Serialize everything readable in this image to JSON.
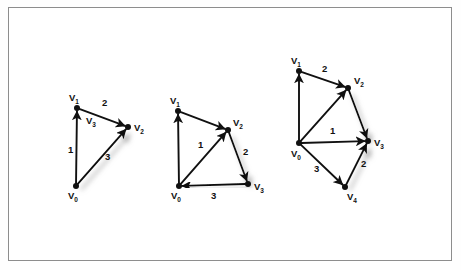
{
  "figure": {
    "title": "",
    "background_color": "#ffffff",
    "frame_color": "#8d8d8d",
    "ink_color": "#111111",
    "shadow_color": "#b9b9b9",
    "graph_count": 3
  },
  "graphs": [
    {
      "name": "graph-1",
      "vertices": [
        {
          "id": "v1",
          "label": "V",
          "sub": "1",
          "x": 77,
          "y": 108,
          "label_x": 69,
          "label_y": 101
        },
        {
          "id": "v2",
          "label": "V",
          "sub": "2",
          "x": 128,
          "y": 127,
          "label_x": 134,
          "label_y": 131
        },
        {
          "id": "v0",
          "label": "V",
          "sub": "0",
          "x": 76,
          "y": 186,
          "label_x": 68,
          "label_y": 199
        }
      ],
      "extra_labels": [
        {
          "id": "v3-note",
          "label": "V",
          "sub": "3",
          "x": 86,
          "y": 124
        }
      ],
      "edges": [
        {
          "id": "e-v0-v1",
          "from": "v0",
          "to": "v1",
          "weight": "1",
          "weight_x": 68,
          "weight_y": 153,
          "shadow": false
        },
        {
          "id": "e-v1-v2",
          "from": "v1",
          "to": "v2",
          "weight": "2",
          "weight_x": 102,
          "weight_y": 106,
          "shadow": false
        },
        {
          "id": "e-v0-v2",
          "from": "v0",
          "to": "v2",
          "weight": "3",
          "weight_x": 105,
          "weight_y": 160,
          "shadow": true
        }
      ]
    },
    {
      "name": "graph-2",
      "vertices": [
        {
          "id": "v1",
          "label": "V",
          "sub": "1",
          "x": 178,
          "y": 111,
          "label_x": 170,
          "label_y": 104
        },
        {
          "id": "v2",
          "label": "V",
          "sub": "2",
          "x": 228,
          "y": 130,
          "label_x": 233,
          "label_y": 126
        },
        {
          "id": "v3",
          "label": "V",
          "sub": "3",
          "x": 248,
          "y": 184,
          "label_x": 254,
          "label_y": 190
        },
        {
          "id": "v0",
          "label": "V",
          "sub": "0",
          "x": 179,
          "y": 186,
          "label_x": 171,
          "label_y": 199
        }
      ],
      "extra_labels": [],
      "edges": [
        {
          "id": "e-v0-v1",
          "from": "v0",
          "to": "v1",
          "weight": "",
          "weight_x": 0,
          "weight_y": 0,
          "shadow": false
        },
        {
          "id": "e-v1-v2",
          "from": "v1",
          "to": "v2",
          "weight": "",
          "weight_x": 0,
          "weight_y": 0,
          "shadow": false
        },
        {
          "id": "e-v0-v2",
          "from": "v0",
          "to": "v2",
          "weight": "1",
          "weight_x": 198,
          "weight_y": 148,
          "shadow": false
        },
        {
          "id": "e-v2-v3",
          "from": "v2",
          "to": "v3",
          "weight": "2",
          "weight_x": 243,
          "weight_y": 155,
          "shadow": true
        },
        {
          "id": "e-v3-v0",
          "from": "v3",
          "to": "v0",
          "weight": "3",
          "weight_x": 211,
          "weight_y": 199,
          "shadow": true
        }
      ]
    },
    {
      "name": "graph-3",
      "vertices": [
        {
          "id": "v1",
          "label": "V",
          "sub": "1",
          "x": 299,
          "y": 71,
          "label_x": 291,
          "label_y": 64
        },
        {
          "id": "v2",
          "label": "V",
          "sub": "2",
          "x": 348,
          "y": 88,
          "label_x": 354,
          "label_y": 84
        },
        {
          "id": "v3",
          "label": "V",
          "sub": "3",
          "x": 368,
          "y": 141,
          "label_x": 374,
          "label_y": 146
        },
        {
          "id": "v0",
          "label": "V",
          "sub": "0",
          "x": 299,
          "y": 143,
          "label_x": 291,
          "label_y": 157
        },
        {
          "id": "v4",
          "label": "V",
          "sub": "4",
          "x": 345,
          "y": 187,
          "label_x": 347,
          "label_y": 200
        }
      ],
      "extra_labels": [],
      "edges": [
        {
          "id": "e-v0-v1",
          "from": "v0",
          "to": "v1",
          "weight": "",
          "weight_x": 0,
          "weight_y": 0,
          "shadow": false
        },
        {
          "id": "e-v1-v2",
          "from": "v1",
          "to": "v2",
          "weight": "2",
          "weight_x": 322,
          "weight_y": 72,
          "shadow": false
        },
        {
          "id": "e-v0-v2",
          "from": "v0",
          "to": "v2",
          "weight": "",
          "weight_x": 0,
          "weight_y": 0,
          "shadow": false
        },
        {
          "id": "e-v2-v3",
          "from": "v2",
          "to": "v3",
          "weight": "",
          "weight_x": 0,
          "weight_y": 0,
          "shadow": true
        },
        {
          "id": "e-v0-v3",
          "from": "v0",
          "to": "v3",
          "weight": "1",
          "weight_x": 330,
          "weight_y": 134,
          "shadow": false
        },
        {
          "id": "e-v0-v4",
          "from": "v0",
          "to": "v4",
          "weight": "3",
          "weight_x": 314,
          "weight_y": 172,
          "shadow": false
        },
        {
          "id": "e-v4-v3",
          "from": "v4",
          "to": "v3",
          "weight": "2",
          "weight_x": 361,
          "weight_y": 167,
          "shadow": true
        }
      ]
    }
  ]
}
